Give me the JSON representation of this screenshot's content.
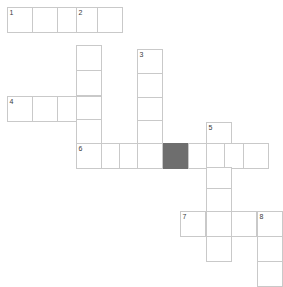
{
  "puzzle": {
    "title": "Crossword Grid",
    "cell_size": 26,
    "grid_origin_x": 7,
    "grid_origin_y": 7,
    "colors": {
      "cell_background": "#ffffff",
      "cell_border": "#c9c9c9",
      "block_fill": "#6e6e6e",
      "number_color": "#3a3a3a",
      "page_background": "#ffffff"
    },
    "clue_numbers": [
      "1",
      "2",
      "3",
      "4",
      "5",
      "6",
      "7",
      "8"
    ],
    "entries": [
      {
        "number": "1",
        "direction": "across",
        "length": 4,
        "start_col": 0,
        "start_row": 0
      },
      {
        "number": "2",
        "direction": "down",
        "length": 6,
        "start_col": 3,
        "start_row": 0
      },
      {
        "number": "3",
        "direction": "down",
        "length": 5,
        "start_col": 5,
        "start_row": 1
      },
      {
        "number": "4",
        "direction": "across",
        "length": 4,
        "start_col": 0,
        "start_row": 3
      },
      {
        "number": "5",
        "direction": "down",
        "length": 5,
        "start_col": 8,
        "start_row": 4
      },
      {
        "number": "6",
        "direction": "across",
        "length": 8,
        "start_col": 3,
        "start_row": 5
      },
      {
        "number": "7",
        "direction": "across",
        "length": 4,
        "start_col": 7,
        "start_row": 8
      },
      {
        "number": "8",
        "direction": "down",
        "length": 3,
        "start_col": 10,
        "start_row": 8
      }
    ],
    "cells": [
      {
        "id": "r0c0",
        "x": 7,
        "y": 7,
        "number": "1",
        "letter": "",
        "block": false
      },
      {
        "id": "r0c1",
        "x": 32,
        "y": 7,
        "number": "",
        "letter": "",
        "block": false
      },
      {
        "id": "r0c2",
        "x": 57,
        "y": 7,
        "number": "",
        "letter": "",
        "block": false
      },
      {
        "id": "r0c3",
        "x": 76,
        "y": 7,
        "number": "2",
        "letter": "",
        "block": false
      },
      {
        "id": "r0c4",
        "x": 97,
        "y": 7,
        "number": "",
        "letter": "",
        "block": false
      },
      {
        "id": "r1c3",
        "x": 76,
        "y": 45,
        "number": "",
        "letter": "",
        "block": false
      },
      {
        "id": "r1c5",
        "x": 137,
        "y": 49,
        "number": "3",
        "letter": "",
        "block": false
      },
      {
        "id": "r2c3",
        "x": 76,
        "y": 70,
        "number": "",
        "letter": "",
        "block": false
      },
      {
        "id": "r2c5",
        "x": 137,
        "y": 73,
        "number": "",
        "letter": "",
        "block": false
      },
      {
        "id": "r3c0",
        "x": 7,
        "y": 96,
        "number": "4",
        "letter": "",
        "block": false
      },
      {
        "id": "r3c1",
        "x": 32,
        "y": 96,
        "number": "",
        "letter": "",
        "block": false
      },
      {
        "id": "r3c2",
        "x": 57,
        "y": 96,
        "number": "",
        "letter": "",
        "block": false
      },
      {
        "id": "r3c3",
        "x": 76,
        "y": 96,
        "number": "",
        "letter": "",
        "block": false
      },
      {
        "id": "r3c5",
        "x": 137,
        "y": 97,
        "number": "",
        "letter": "",
        "block": false
      },
      {
        "id": "r4c3",
        "x": 76,
        "y": 119,
        "number": "",
        "letter": "",
        "block": false
      },
      {
        "id": "r4c5",
        "x": 137,
        "y": 120,
        "number": "",
        "letter": "",
        "block": false
      },
      {
        "id": "r4c8",
        "x": 206,
        "y": 122,
        "number": "5",
        "letter": "",
        "block": false
      },
      {
        "id": "r5c3",
        "x": 76,
        "y": 143,
        "number": "6",
        "letter": "",
        "block": false
      },
      {
        "id": "r5c4",
        "x": 101,
        "y": 143,
        "number": "",
        "letter": "",
        "block": false
      },
      {
        "id": "r5c5",
        "x": 119,
        "y": 143,
        "number": "",
        "letter": "",
        "block": false
      },
      {
        "id": "r5c6",
        "x": 137,
        "y": 143,
        "number": "",
        "letter": "",
        "block": false
      },
      {
        "id": "r5c7",
        "x": 163,
        "y": 143,
        "number": "",
        "letter": "",
        "block": true
      },
      {
        "id": "r5c8",
        "x": 188,
        "y": 143,
        "number": "",
        "letter": "",
        "block": false
      },
      {
        "id": "r5c9",
        "x": 206,
        "y": 143,
        "number": "",
        "letter": "",
        "block": false
      },
      {
        "id": "r5c10",
        "x": 224,
        "y": 143,
        "number": "",
        "letter": "",
        "block": false
      },
      {
        "id": "r5c11",
        "x": 243,
        "y": 143,
        "number": "",
        "letter": "",
        "block": false
      },
      {
        "id": "r6c8",
        "x": 206,
        "y": 167,
        "number": "",
        "letter": "",
        "block": false
      },
      {
        "id": "r7c8",
        "x": 206,
        "y": 188,
        "number": "",
        "letter": "",
        "block": false
      },
      {
        "id": "r8c7",
        "x": 180,
        "y": 211,
        "number": "7",
        "letter": "",
        "block": false
      },
      {
        "id": "r8c8",
        "x": 206,
        "y": 211,
        "number": "",
        "letter": "",
        "block": false
      },
      {
        "id": "r8c9",
        "x": 231,
        "y": 211,
        "number": "",
        "letter": "",
        "block": false
      },
      {
        "id": "r8c10",
        "x": 257,
        "y": 211,
        "number": "8",
        "letter": "",
        "block": false
      },
      {
        "id": "r9c8",
        "x": 206,
        "y": 236,
        "number": "",
        "letter": "",
        "block": false
      },
      {
        "id": "r9c10",
        "x": 257,
        "y": 236,
        "number": "",
        "letter": "",
        "block": false
      },
      {
        "id": "r10c10",
        "x": 257,
        "y": 261,
        "number": "",
        "letter": "",
        "block": false
      }
    ]
  }
}
